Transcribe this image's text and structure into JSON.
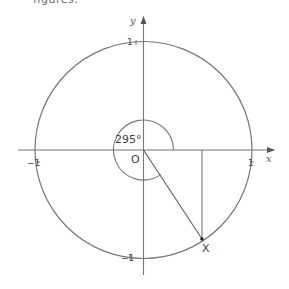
{
  "caption": {
    "text": "figures."
  },
  "diagram": {
    "type": "unit-circle",
    "axes": {
      "x_label": "x",
      "y_label": "y"
    },
    "tick_labels": {
      "top": "1",
      "bottom": "−1",
      "left": "−1",
      "right": "1"
    },
    "origin_label": "O",
    "angle_label": "295°",
    "angle_degrees": 295,
    "point_label": "X",
    "colors": {
      "line": "#777777",
      "text": "#444444",
      "background": "#ffffff"
    }
  }
}
